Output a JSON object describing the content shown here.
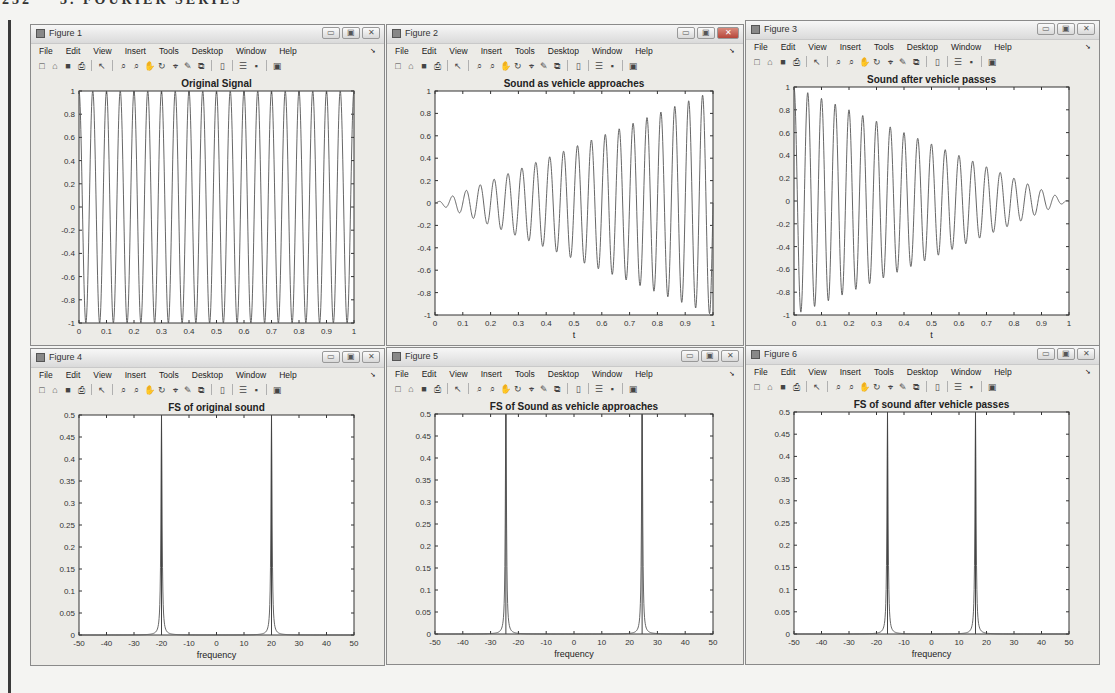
{
  "page": {
    "header_left": "232",
    "header_right": "3. FOURIER SERIES"
  },
  "menu_items": [
    "File",
    "Edit",
    "View",
    "Insert",
    "Tools",
    "Desktop",
    "Window",
    "Help"
  ],
  "toolbar_icons": [
    "new-figure-icon",
    "open-file-icon",
    "save-icon",
    "print-icon",
    "edit-plot-icon",
    "zoom-in-icon",
    "zoom-out-icon",
    "pan-icon",
    "rotate-3d-icon",
    "data-cursor-icon",
    "brush-icon",
    "link-plot-icon",
    "colorbar-icon",
    "legend-icon",
    "hide-plot-tools-icon",
    "show-plot-tools-icon"
  ],
  "window_buttons": {
    "minimize": "▭",
    "maximize": "▣",
    "close": "✕"
  },
  "figures": [
    {
      "window_title": "Figure 1",
      "active": false
    },
    {
      "window_title": "Figure 2",
      "active": true
    },
    {
      "window_title": "Figure 3",
      "active": false
    },
    {
      "window_title": "Figure 4",
      "active": false
    },
    {
      "window_title": "Figure 5",
      "active": false
    },
    {
      "window_title": "Figure 6",
      "active": false
    }
  ],
  "chart_data": [
    {
      "type": "line",
      "title": "Original Signal",
      "xlabel": "",
      "ylabel": "",
      "xlim": [
        0,
        1
      ],
      "ylim": [
        -1,
        1
      ],
      "xticks": [
        "0",
        "0.1",
        "0.2",
        "0.3",
        "0.4",
        "0.5",
        "0.6",
        "0.7",
        "0.8",
        "0.9",
        "1"
      ],
      "yticks": [
        "-1",
        "-0.8",
        "-0.6",
        "-0.4",
        "-0.2",
        "0",
        "0.2",
        "0.4",
        "0.6",
        "0.8",
        "1"
      ],
      "signal": {
        "kind": "cosine",
        "frequency_hz": 20,
        "envelope": "constant",
        "amplitude": 1
      },
      "grid": false
    },
    {
      "type": "line",
      "title": "Sound as vehicle approaches",
      "xlabel": "t",
      "ylabel": "",
      "xlim": [
        0,
        1
      ],
      "ylim": [
        -1,
        1
      ],
      "xticks": [
        "0",
        "0.1",
        "0.2",
        "0.3",
        "0.4",
        "0.5",
        "0.6",
        "0.7",
        "0.8",
        "0.9",
        "1"
      ],
      "yticks": [
        "-1",
        "-0.8",
        "-0.6",
        "-0.4",
        "-0.2",
        "0",
        "0.2",
        "0.4",
        "0.6",
        "0.8",
        "1"
      ],
      "signal": {
        "kind": "sine",
        "frequency_hz": 20,
        "envelope": "linear-increasing",
        "amplitude_start": 0,
        "amplitude_end": 1
      },
      "grid": false
    },
    {
      "type": "line",
      "title": "Sound after vehicle passes",
      "xlabel": "t",
      "ylabel": "",
      "xlim": [
        0,
        1
      ],
      "ylim": [
        -1,
        1
      ],
      "xticks": [
        "0",
        "0.1",
        "0.2",
        "0.3",
        "0.4",
        "0.5",
        "0.6",
        "0.7",
        "0.8",
        "0.9",
        "1"
      ],
      "yticks": [
        "-1",
        "-0.8",
        "-0.6",
        "-0.4",
        "-0.2",
        "0",
        "0.2",
        "0.4",
        "0.6",
        "0.8",
        "1"
      ],
      "signal": {
        "kind": "cosine",
        "frequency_hz": 20,
        "envelope": "linear-decreasing",
        "amplitude_start": 1,
        "amplitude_end": 0
      },
      "grid": false
    },
    {
      "type": "line",
      "title": "FS of original sound",
      "xlabel": "frequency",
      "ylabel": "",
      "xlim": [
        -50,
        50
      ],
      "ylim": [
        0,
        0.5
      ],
      "xticks": [
        "-50",
        "-40",
        "-30",
        "-20",
        "-10",
        "0",
        "10",
        "20",
        "30",
        "40",
        "50"
      ],
      "yticks": [
        "0",
        "0.05",
        "0.1",
        "0.15",
        "0.2",
        "0.25",
        "0.3",
        "0.35",
        "0.4",
        "0.45",
        "0.5"
      ],
      "peaks": [
        {
          "x": -20,
          "y": 0.5
        },
        {
          "x": 20,
          "y": 0.5
        }
      ],
      "grid": false
    },
    {
      "type": "line",
      "title": "FS of Sound as vehicle approaches",
      "xlabel": "frequency",
      "ylabel": "",
      "xlim": [
        -50,
        50
      ],
      "ylim": [
        0,
        0.5
      ],
      "xticks": [
        "-50",
        "-40",
        "-30",
        "-20",
        "-10",
        "0",
        "10",
        "20",
        "30",
        "40",
        "50"
      ],
      "yticks": [
        "0",
        "0.05",
        "0.1",
        "0.15",
        "0.2",
        "0.25",
        "0.3",
        "0.35",
        "0.4",
        "0.45",
        "0.5"
      ],
      "peaks": [
        {
          "x": -24.5,
          "y": 0.5
        },
        {
          "x": 24.5,
          "y": 0.5
        }
      ],
      "grid": false
    },
    {
      "type": "line",
      "title": "FS of sound after vehicle passes",
      "xlabel": "frequency",
      "ylabel": "",
      "xlim": [
        -50,
        50
      ],
      "ylim": [
        0,
        0.5
      ],
      "xticks": [
        "-50",
        "-40",
        "-30",
        "-20",
        "-10",
        "0",
        "10",
        "20",
        "30",
        "40",
        "50"
      ],
      "yticks": [
        "0",
        "0.05",
        "0.1",
        "0.15",
        "0.2",
        "0.25",
        "0.3",
        "0.35",
        "0.4",
        "0.45",
        "0.5"
      ],
      "peaks": [
        {
          "x": -16,
          "y": 0.5
        },
        {
          "x": 16,
          "y": 0.5
        }
      ],
      "grid": false
    }
  ]
}
